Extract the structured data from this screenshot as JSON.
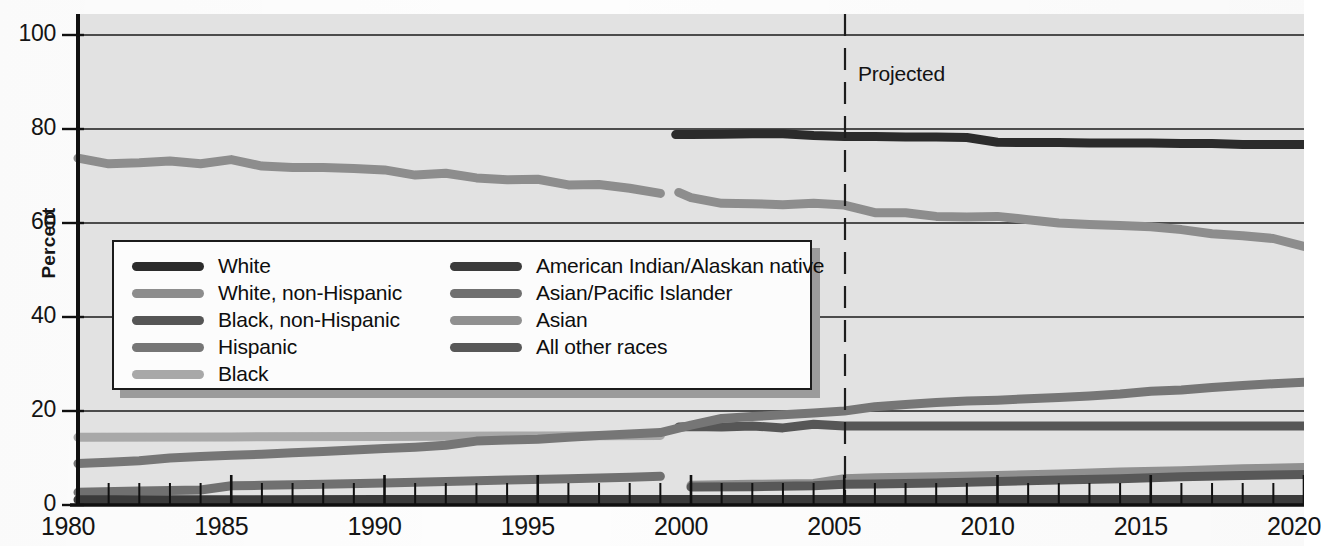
{
  "chart_data": {
    "type": "line",
    "title": "",
    "xlabel": "",
    "ylabel": "Percent",
    "xlim": [
      1980,
      2020
    ],
    "ylim": [
      0,
      100
    ],
    "yticks": [
      0,
      20,
      40,
      60,
      80,
      100
    ],
    "xticks": [
      1980,
      1985,
      1990,
      1995,
      2000,
      2005,
      2010,
      2015,
      2020
    ],
    "grid": "horizontal",
    "legend_position": "inside-left-middle",
    "annotations": [
      {
        "text": "Projected",
        "x": 2005,
        "note": "vertical dashed divider at 2005"
      }
    ],
    "series": [
      {
        "name": "White",
        "color": "#2b2b2b",
        "x": [
          1999.5,
          2000,
          2001,
          2002,
          2003,
          2004,
          2005,
          2006,
          2007,
          2008,
          2009,
          2010,
          2011,
          2012,
          2013,
          2014,
          2015,
          2016,
          2017,
          2018,
          2019,
          2020
        ],
        "values": [
          78.8,
          78.8,
          78.9,
          79.0,
          79.0,
          78.6,
          78.4,
          78.4,
          78.3,
          78.3,
          78.2,
          77.2,
          77.1,
          77.1,
          77.0,
          77.0,
          77.0,
          76.9,
          76.9,
          76.7,
          76.7,
          76.7
        ]
      },
      {
        "name": "White, non-Hispanic",
        "color": "#8d8d8d",
        "x": [
          1980,
          1981,
          1982,
          1983,
          1984,
          1985,
          1986,
          1987,
          1988,
          1989,
          1990,
          1991,
          1992,
          1993,
          1994,
          1995,
          1996,
          1997,
          1998,
          1999,
          1999.6,
          2000,
          2001,
          2002,
          2003,
          2004,
          2005,
          2006,
          2007,
          2008,
          2009,
          2010,
          2011,
          2012,
          2013,
          2014,
          2015,
          2016,
          2017,
          2018,
          2019,
          2020
        ],
        "values": [
          73.8,
          72.6,
          72.8,
          73.2,
          72.6,
          73.5,
          72.1,
          71.8,
          71.8,
          71.6,
          71.3,
          70.2,
          70.6,
          69.6,
          69.2,
          69.3,
          68.1,
          68.2,
          67.4,
          66.3,
          66.5,
          65.4,
          64.2,
          64.1,
          63.9,
          64.2,
          63.8,
          62.2,
          62.2,
          61.4,
          61.3,
          61.4,
          60.7,
          60.0,
          59.7,
          59.5,
          59.2,
          58.6,
          57.7,
          57.3,
          56.7,
          55.0
        ],
        "note": "two plotted segments: 1980-1999 and 2000-2020 (second starts lower at ~62)"
      },
      {
        "name": "Black, non-Hispanic",
        "color": "#565656",
        "x": [
          1999.6,
          2000,
          2001,
          2002,
          2003,
          2004,
          2005,
          2006,
          2007,
          2008,
          2009,
          2010,
          2011,
          2012,
          2013,
          2014,
          2015,
          2016,
          2017,
          2018,
          2019,
          2020
        ],
        "values": [
          16.6,
          16.7,
          16.6,
          16.8,
          16.4,
          17.2,
          16.8,
          16.8,
          16.8,
          16.8,
          16.8,
          16.8,
          16.8,
          16.8,
          16.8,
          16.8,
          16.8,
          16.8,
          16.8,
          16.8,
          16.8,
          16.8
        ]
      },
      {
        "name": "Hispanic",
        "color": "#767676",
        "x": [
          1980,
          1981,
          1982,
          1983,
          1984,
          1985,
          1986,
          1987,
          1988,
          1989,
          1990,
          1991,
          1992,
          1993,
          1994,
          1995,
          1996,
          1997,
          1998,
          1999,
          2000,
          2001,
          2002,
          2003,
          2004,
          2005,
          2006,
          2007,
          2008,
          2009,
          2010,
          2011,
          2012,
          2013,
          2014,
          2015,
          2016,
          2017,
          2018,
          2019,
          2020
        ],
        "values": [
          8.8,
          9.1,
          9.4,
          10.0,
          10.3,
          10.6,
          10.8,
          11.1,
          11.4,
          11.7,
          12.0,
          12.3,
          12.7,
          13.6,
          13.8,
          14.0,
          14.4,
          14.8,
          15.1,
          15.4,
          17.0,
          18.4,
          18.8,
          19.2,
          19.6,
          20.0,
          20.9,
          21.4,
          21.8,
          22.1,
          22.3,
          22.6,
          22.9,
          23.2,
          23.6,
          24.2,
          24.5,
          25.0,
          25.4,
          25.8,
          26.1
        ]
      },
      {
        "name": "Black",
        "color": "#a8a8a8",
        "x": [
          1980,
          1985,
          1990,
          1995,
          1999
        ],
        "values": [
          14.4,
          14.5,
          14.6,
          14.7,
          14.8
        ],
        "note": "flat line near 14.5 percent ending 1999"
      },
      {
        "name": "American Indian/Alaskan native",
        "color": "#3b3b3b",
        "x": [
          1980,
          1985,
          1990,
          1995,
          2000,
          2005,
          2010,
          2015,
          2020
        ],
        "values": [
          1.1,
          1.1,
          1.2,
          1.2,
          1.2,
          1.2,
          1.2,
          1.2,
          1.2
        ],
        "note": "lowest flat line, overlapped near baseline"
      },
      {
        "name": "Asian/Pacific Islander",
        "color": "#707070",
        "x": [
          1980,
          1982,
          1984,
          1985,
          1986,
          1988,
          1990,
          1992,
          1994,
          1996,
          1998,
          1999
        ],
        "values": [
          2.7,
          3.0,
          3.2,
          4.1,
          4.2,
          4.4,
          4.7,
          5.0,
          5.3,
          5.6,
          5.9,
          6.1
        ]
      },
      {
        "name": "Asian",
        "color": "#909090",
        "x": [
          2000,
          2002,
          2004,
          2005,
          2006,
          2008,
          2010,
          2012,
          2014,
          2016,
          2018,
          2020
        ],
        "values": [
          4.2,
          4.4,
          4.6,
          5.6,
          5.8,
          6.0,
          6.3,
          6.6,
          7.0,
          7.3,
          7.7,
          8.0
        ]
      },
      {
        "name": "All other races",
        "color": "#585858",
        "x": [
          2000,
          2002,
          2004,
          2005,
          2006,
          2008,
          2010,
          2012,
          2014,
          2016,
          2018,
          2020
        ],
        "values": [
          3.8,
          3.9,
          4.1,
          4.4,
          4.5,
          4.7,
          5.0,
          5.3,
          5.6,
          6.0,
          6.3,
          6.5
        ]
      }
    ]
  },
  "axis": {
    "y_title": "Percent",
    "y_ticks": [
      "100",
      "80",
      "60",
      "40",
      "20",
      "0"
    ],
    "x_ticks": [
      "1980",
      "1985",
      "1990",
      "1995",
      "2000",
      "2005",
      "2010",
      "2015",
      "2020"
    ]
  },
  "annotation": {
    "projected": "Projected"
  },
  "legend": {
    "left_column": [
      {
        "label": "White",
        "color": "#2b2b2b"
      },
      {
        "label": "White, non-Hispanic",
        "color": "#8d8d8d"
      },
      {
        "label": "Black, non-Hispanic",
        "color": "#565656"
      },
      {
        "label": "Hispanic",
        "color": "#767676"
      },
      {
        "label": "Black",
        "color": "#a8a8a8"
      }
    ],
    "right_column": [
      {
        "label": "American Indian/Alaskan native",
        "color": "#3b3b3b"
      },
      {
        "label": "Asian/Pacific Islander",
        "color": "#707070"
      },
      {
        "label": "Asian",
        "color": "#909090"
      },
      {
        "label": "All other races",
        "color": "#585858"
      }
    ]
  }
}
